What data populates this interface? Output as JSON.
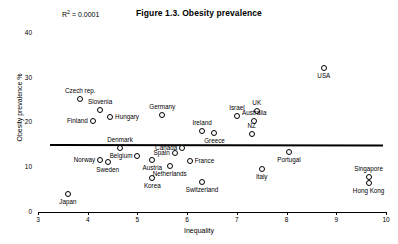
{
  "chart_data": {
    "type": "scatter",
    "title": "Figure 1.3. Obesity prevalence",
    "xlabel": "Inequality",
    "ylabel": "Obesity prevalence %",
    "xlim": [
      3,
      10
    ],
    "ylim": [
      0,
      42
    ],
    "xticks": [
      3,
      4,
      5,
      6,
      7,
      8,
      9,
      10
    ],
    "yticks": [
      0,
      10,
      20,
      30,
      40
    ],
    "grid": false,
    "legend": "none",
    "annotations": [
      {
        "name": "r-squared",
        "text": "R² = 0.0001"
      }
    ],
    "trendline": {
      "type": "linear",
      "r_squared": 0.0001,
      "x_start": 3.25,
      "y_start": 15.1,
      "x_end": 9.95,
      "y_end": 15.0
    },
    "points": [
      {
        "label": "Czech rep.",
        "x": 3.85,
        "y": 25.3,
        "label_pos": "above"
      },
      {
        "label": "Slovenia",
        "x": 4.25,
        "y": 22.7,
        "label_pos": "above"
      },
      {
        "label": "Hungary",
        "x": 4.45,
        "y": 21.3,
        "label_pos": "right"
      },
      {
        "label": "Finland",
        "x": 4.1,
        "y": 20.4,
        "label_pos": "left"
      },
      {
        "label": "Denmark",
        "x": 4.65,
        "y": 14.2,
        "label_pos": "above"
      },
      {
        "label": "Norway",
        "x": 4.25,
        "y": 11.7,
        "label_pos": "left"
      },
      {
        "label": "Sweden",
        "x": 4.4,
        "y": 11.2,
        "label_pos": "below"
      },
      {
        "label": "Belgium",
        "x": 5.0,
        "y": 12.5,
        "label_pos": "left"
      },
      {
        "label": "Austria",
        "x": 5.3,
        "y": 11.7,
        "label_pos": "below"
      },
      {
        "label": "Germany",
        "x": 5.5,
        "y": 21.7,
        "label_pos": "above"
      },
      {
        "label": "Netherlands",
        "x": 5.65,
        "y": 10.2,
        "label_pos": "below"
      },
      {
        "label": "Spain",
        "x": 5.75,
        "y": 13.1,
        "label_pos": "left"
      },
      {
        "label": "Canada",
        "x": 5.9,
        "y": 14.4,
        "label_pos": "left"
      },
      {
        "label": "France",
        "x": 6.05,
        "y": 11.3,
        "label_pos": "right"
      },
      {
        "label": "Ireland",
        "x": 6.3,
        "y": 18.0,
        "label_pos": "above"
      },
      {
        "label": "Greece",
        "x": 6.55,
        "y": 17.6,
        "label_pos": "below"
      },
      {
        "label": "Korea",
        "x": 5.3,
        "y": 7.5,
        "label_pos": "below"
      },
      {
        "label": "Japan",
        "x": 3.6,
        "y": 4.0,
        "label_pos": "below"
      },
      {
        "label": "Switzerland",
        "x": 6.3,
        "y": 6.8,
        "label_pos": "below"
      },
      {
        "label": "Israel",
        "x": 7.0,
        "y": 21.5,
        "label_pos": "above"
      },
      {
        "label": "UK",
        "x": 7.4,
        "y": 22.5,
        "label_pos": "above"
      },
      {
        "label": "Australia",
        "x": 7.35,
        "y": 20.3,
        "label_pos": "above"
      },
      {
        "label": "NZ",
        "x": 7.3,
        "y": 17.4,
        "label_pos": "above"
      },
      {
        "label": "Italy",
        "x": 7.5,
        "y": 9.7,
        "label_pos": "below"
      },
      {
        "label": "Portugal",
        "x": 8.05,
        "y": 13.5,
        "label_pos": "below"
      },
      {
        "label": "Singapore",
        "x": 9.65,
        "y": 7.9,
        "label_pos": "above"
      },
      {
        "label": "Hong Kong",
        "x": 9.65,
        "y": 6.5,
        "label_pos": "below"
      },
      {
        "label": "USA",
        "x": 8.75,
        "y": 32.2,
        "label_pos": "below"
      }
    ]
  }
}
